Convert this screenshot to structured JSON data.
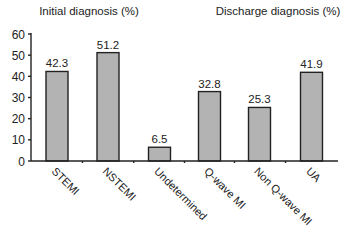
{
  "chart_data": {
    "type": "bar",
    "title": "",
    "xlabel": "",
    "ylabel": "",
    "ylim": [
      0,
      60
    ],
    "yticks": [
      0,
      10,
      20,
      30,
      40,
      50,
      60
    ],
    "grid": false,
    "bar_color": "#b3b3b3",
    "groups": [
      {
        "title": "Initial diagnosis (%)",
        "categories": [
          "STEMI",
          "NSTEMI",
          "Undetermined"
        ]
      },
      {
        "title": "Discharge diagnosis (%)",
        "categories": [
          "Q-wave MI",
          "Non Q-wave MI",
          "UA"
        ]
      }
    ],
    "categories": [
      "STEMI",
      "NSTEMI",
      "Undetermined",
      "Q-wave MI",
      "Non Q-wave MI",
      "UA"
    ],
    "values": [
      42.3,
      51.2,
      6.5,
      32.8,
      25.3,
      41.9
    ],
    "value_labels": [
      "42.3",
      "51.2",
      "6.5",
      "32.8",
      "25.3",
      "41.9"
    ]
  }
}
